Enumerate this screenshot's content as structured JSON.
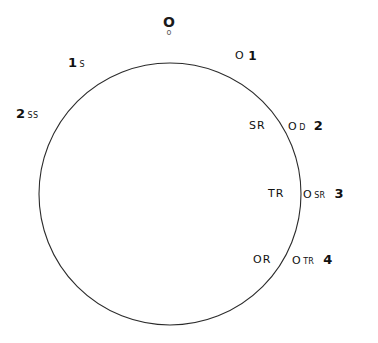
{
  "figure": {
    "type": "circle-diagram",
    "circle": {
      "center_x": 170,
      "center_y": 194,
      "radius": 131,
      "stroke_color": "#2b2b2b",
      "stroke_width": 1.1,
      "fill": "none"
    },
    "background_color": "#ffffff",
    "text_color": "#111111"
  },
  "labels": {
    "top": {
      "symbol": "O",
      "subscript": "o"
    },
    "outside": [
      {
        "index": "1",
        "subscript": "S",
        "symbol": "",
        "sym_sub": ""
      },
      {
        "index": "2",
        "subscript": "SS",
        "symbol": "",
        "sym_sub": ""
      }
    ],
    "right_side": [
      {
        "symbol": "O",
        "sym_sub": "",
        "sym_sup": "1",
        "index": "",
        "inner": ""
      },
      {
        "symbol": "O",
        "sym_sub": "D",
        "sym_sup": "",
        "index": "2",
        "inner": "SR"
      },
      {
        "symbol": "O",
        "sym_sub": "SR",
        "sym_sup": "",
        "index": "3",
        "inner": "TR"
      },
      {
        "symbol": "O",
        "sym_sub": "TR",
        "sym_sup": "",
        "index": "4",
        "inner": "OR"
      }
    ],
    "left_side": [
      {
        "index": "1",
        "sub": "S"
      },
      {
        "index": "2",
        "sub": "SS"
      }
    ],
    "interior": [
      {
        "text": "SR"
      },
      {
        "text": "TR"
      },
      {
        "text": "OR"
      }
    ]
  }
}
